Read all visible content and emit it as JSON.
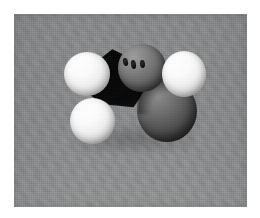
{
  "figure": {
    "kind": "photograph",
    "subject_name": "space-filling-molecular-model",
    "caption": "",
    "color_mode": "grayscale",
    "border_color": "#ffffff",
    "plate": {
      "background_color": "#898a8b",
      "texture": "fine-grain",
      "left": 14,
      "top": 14,
      "width": 233,
      "height": 193
    }
  },
  "molecule": {
    "model_type": "space-filling",
    "shadow_label": "central-bond-shadow",
    "atoms": [
      {
        "id": "atom-gray-top",
        "role": "central-atom",
        "sphere_color": "#6f6f6f",
        "highlight_color": "#9d9d9d",
        "position": "upper-center",
        "socket_count": 3
      },
      {
        "id": "atom-white-left",
        "role": "terminal-atom",
        "sphere_color": "#f2f2f2",
        "highlight_color": "#ffffff",
        "position": "left"
      },
      {
        "id": "atom-white-right",
        "role": "terminal-atom",
        "sphere_color": "#f2f2f2",
        "highlight_color": "#ffffff",
        "position": "upper-right"
      },
      {
        "id": "atom-white-bottom-left",
        "role": "terminal-atom",
        "sphere_color": "#f2f2f2",
        "highlight_color": "#ffffff",
        "position": "lower-left"
      },
      {
        "id": "atom-gray-lower-right",
        "role": "second-atom",
        "sphere_color": "#636363",
        "highlight_color": "#8e8e8e",
        "position": "lower-right"
      }
    ],
    "core_color": "#070707"
  }
}
